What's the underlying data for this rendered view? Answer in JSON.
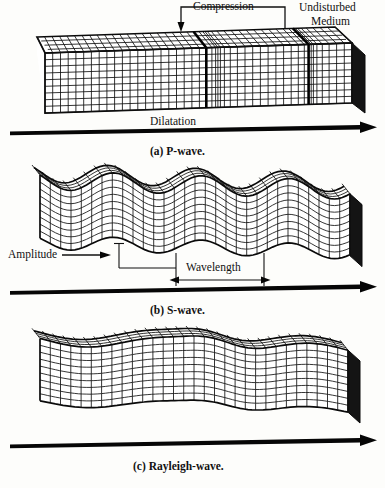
{
  "figure": {
    "ink_color": "#111111",
    "background_color": "#fdfdfb"
  },
  "panels": [
    {
      "id": "p-wave",
      "caption": "(a) P-wave.",
      "labels": {
        "compression": "Compression",
        "undisturbed_medium_line1": "Undisturbed",
        "undisturbed_medium_line2": "Medium",
        "dilatation": "Dilatation"
      },
      "propagation_arrow": "direction-of-propagation-arrow"
    },
    {
      "id": "s-wave",
      "caption": "(b) S-wave.",
      "labels": {
        "amplitude": "Amplitude",
        "wavelength": "Wavelength"
      },
      "propagation_arrow": "direction-of-propagation-arrow"
    },
    {
      "id": "rayleigh-wave",
      "caption": "(c) Rayleigh-wave.",
      "labels": {},
      "propagation_arrow": "direction-of-propagation-arrow"
    }
  ],
  "chart_data": {
    "type": "diagram",
    "panel_count": 3,
    "panels": [
      {
        "name": "P-wave",
        "caption": "(a) P-wave.",
        "wave_type": "compressional",
        "annotations": [
          "Compression",
          "Undisturbed Medium",
          "Dilatation"
        ],
        "compression_band_positions_pct": [
          52,
          86
        ],
        "grid_columns": 46,
        "grid_rows": 9
      },
      {
        "name": "S-wave",
        "caption": "(b) S-wave.",
        "wave_type": "transverse shear",
        "annotations": [
          "Amplitude",
          "Wavelength"
        ],
        "amplitude_px": 13,
        "wavelength_px": 88,
        "grid_columns": 30,
        "grid_rows": 9
      },
      {
        "name": "Rayleigh-wave",
        "caption": "(c) Rayleigh-wave.",
        "wave_type": "surface",
        "annotations": [],
        "grid_columns": 30,
        "grid_rows": 9
      }
    ]
  }
}
